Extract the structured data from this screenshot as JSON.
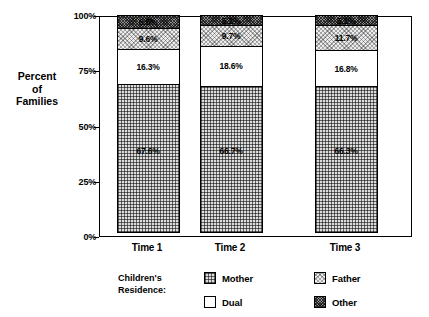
{
  "axis_title": {
    "lines": [
      "Percent",
      "of",
      "Families"
    ]
  },
  "legend": {
    "title_lines": [
      "Children's",
      "Residence:"
    ],
    "items": [
      {
        "label": "Mother",
        "pattern": "crosshatch-dense",
        "color": "#dcdcdc"
      },
      {
        "label": "Father",
        "pattern": "stipple-light",
        "color": "#ececec"
      },
      {
        "label": "Dual",
        "pattern": "solid-white",
        "color": "#ffffff"
      },
      {
        "label": "Other",
        "pattern": "crosshatch-dark",
        "color": "#8f8f8f"
      }
    ]
  },
  "chart_data": {
    "type": "bar",
    "stacked": true,
    "normalized_percent": true,
    "title": "",
    "xlabel": "",
    "ylabel": "Percent of Families",
    "ylim": [
      0,
      100
    ],
    "yticks": [
      "0%",
      "25%",
      "50%",
      "75%",
      "100%"
    ],
    "ytick_values": [
      0,
      25,
      50,
      75,
      100
    ],
    "grid": false,
    "legend_position": "bottom",
    "categories": [
      "Time 1",
      "Time 2",
      "Time 3"
    ],
    "series": [
      {
        "name": "Mother",
        "values": [
          67.6,
          66.7,
          66.3
        ],
        "labels": [
          "67.6%",
          "66.7%",
          "66.3%"
        ]
      },
      {
        "name": "Dual",
        "values": [
          16.3,
          18.6,
          16.8
        ],
        "labels": [
          "16.3%",
          "18.6%",
          "16.8%"
        ]
      },
      {
        "name": "Father",
        "values": [
          9.6,
          9.7,
          11.7
        ],
        "labels": [
          "9.6%",
          "9.7%",
          "11.7%"
        ]
      },
      {
        "name": "Other",
        "values": [
          6.5,
          5.1,
          5.1
        ],
        "labels": [
          "6.5%",
          "5.1%",
          "5.1%"
        ]
      }
    ]
  }
}
